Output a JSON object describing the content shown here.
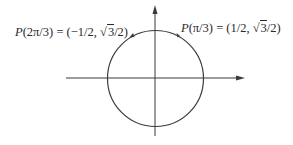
{
  "diagram": {
    "type": "unit-circle",
    "colors": {
      "stroke": "#3a3a3a",
      "text": "#2a2a2a",
      "background": "#ffffff"
    },
    "axes": {
      "x_axis": {
        "direction": "right",
        "arrow": true
      },
      "y_axis": {
        "direction": "up",
        "arrow": true
      }
    },
    "points": [
      {
        "name": "P(2π/3)",
        "func": "P",
        "arg": "(2π/3)",
        "eq": " = (−1/2, ",
        "sqrt_num": "3",
        "tail": "/2)",
        "angle": "2π/3",
        "coords": "(−1/2, √3/2)"
      },
      {
        "name": "P(π/3)",
        "func": "P",
        "arg": "(π/3)",
        "eq": " = (1/2, ",
        "sqrt_num": "3",
        "tail": "/2)",
        "angle": "π/3",
        "coords": "(1/2, √3/2)"
      }
    ]
  }
}
